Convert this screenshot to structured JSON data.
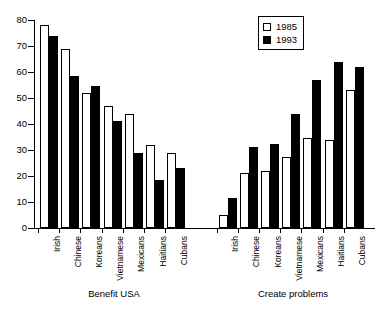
{
  "chart_data": {
    "type": "bar",
    "title": "",
    "subtitle": "",
    "xlabel": "",
    "ylabel": "",
    "ylim": [
      0,
      80
    ],
    "ytick_labels": [
      "0",
      "10",
      "20",
      "30",
      "40",
      "50",
      "60",
      "70",
      "80"
    ],
    "ytick_values": [
      0,
      10,
      20,
      30,
      40,
      50,
      60,
      70,
      80
    ],
    "grid": false,
    "legend_position": "top-right",
    "legend": [
      "1985",
      "1993"
    ],
    "group_labels": [
      "Benefit USA",
      "Create problems"
    ],
    "categories": [
      "Irish",
      "Chinese",
      "Koreans",
      "Vietnamese",
      "Mexicans",
      "Haitians",
      "Cubans"
    ],
    "groups": [
      {
        "name": "Benefit USA",
        "categories": [
          "Irish",
          "Chinese",
          "Koreans",
          "Vietnamese",
          "Mexicans",
          "Haitians",
          "Cubans"
        ],
        "series": [
          {
            "name": "1985",
            "values": [
              78,
              69,
              52,
              47,
              44,
              32,
              29
            ]
          },
          {
            "name": "1993",
            "values": [
              74,
              58.5,
              54.5,
              41,
              29,
              18.5,
              23
            ]
          }
        ]
      },
      {
        "name": "Create problems",
        "categories": [
          "Irish",
          "Chinese",
          "Koreans",
          "Vietnamese",
          "Mexicans",
          "Haitians",
          "Cubans"
        ],
        "series": [
          {
            "name": "1985",
            "values": [
              5,
              21,
              22,
              27.5,
              34.5,
              34,
              53
            ]
          },
          {
            "name": "1993",
            "values": [
              11.5,
              31,
              32.5,
              44,
              57,
              64,
              62
            ]
          }
        ]
      }
    ],
    "colors": {
      "series_1985": "#ffffff",
      "series_1993": "#000000",
      "axis": "#000000",
      "background": "#ffffff"
    }
  }
}
